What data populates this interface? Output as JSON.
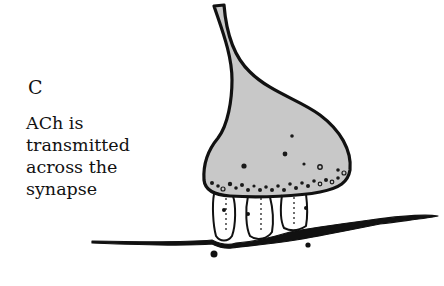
{
  "panel": {
    "letter": "C",
    "description_lines": [
      "ACh is",
      "transmitted",
      "across the",
      "synapse"
    ]
  },
  "diagram": {
    "subject": "synapse",
    "parts": [
      "axon-terminal",
      "synaptic-vesicles",
      "synaptic-cleft",
      "postsynaptic-membrane"
    ],
    "colors": {
      "terminal_fill": "#c8c8c8",
      "outline": "#111111",
      "background": "#ffffff"
    }
  }
}
